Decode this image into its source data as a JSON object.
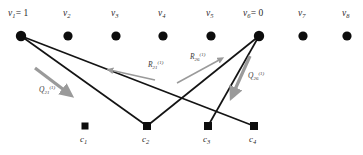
{
  "figure": {
    "type": "tanner-graph",
    "width": 363,
    "height": 155,
    "background": "#ffffff",
    "edge_color": "#141414",
    "node_color": "#0d0d0d",
    "arrow_color": "#9a9a9a"
  },
  "variable_nodes": [
    {
      "id": "v1",
      "label": "v",
      "sub": "1",
      "value": "= 1",
      "x": 21,
      "y": 36,
      "r": 5.2
    },
    {
      "id": "v2",
      "label": "v",
      "sub": "2",
      "value": "",
      "x": 68,
      "y": 36,
      "r": 4.6
    },
    {
      "id": "v3",
      "label": "v",
      "sub": "3",
      "value": "",
      "x": 116,
      "y": 36,
      "r": 4.6
    },
    {
      "id": "v4",
      "label": "v",
      "sub": "4",
      "value": "",
      "x": 163,
      "y": 36,
      "r": 4.6
    },
    {
      "id": "v5",
      "label": "v",
      "sub": "5",
      "value": "",
      "x": 211,
      "y": 36,
      "r": 4.6
    },
    {
      "id": "v6",
      "label": "v",
      "sub": "6",
      "value": "= 0",
      "x": 259,
      "y": 36,
      "r": 5.2
    },
    {
      "id": "v7",
      "label": "v",
      "sub": "7",
      "value": "",
      "x": 303,
      "y": 36,
      "r": 4.6
    },
    {
      "id": "v8",
      "label": "v",
      "sub": "8",
      "value": "",
      "x": 347,
      "y": 36,
      "r": 4.6
    }
  ],
  "check_nodes": [
    {
      "id": "c1",
      "label": "c",
      "sub": "1",
      "x": 85,
      "y": 126,
      "size": 7
    },
    {
      "id": "c2",
      "label": "c",
      "sub": "2",
      "x": 147,
      "y": 126,
      "size": 8
    },
    {
      "id": "c3",
      "label": "c",
      "sub": "3",
      "x": 208,
      "y": 126,
      "size": 8
    },
    {
      "id": "c4",
      "label": "c",
      "sub": "4",
      "x": 254,
      "y": 126,
      "size": 8
    }
  ],
  "edges": [
    {
      "id": "e-v1-c2",
      "from": "v1",
      "to": "c2"
    },
    {
      "id": "e-v1-c4",
      "from": "v1",
      "to": "c4"
    },
    {
      "id": "e-v6-c2",
      "from": "v6",
      "to": "c2"
    },
    {
      "id": "e-v6-c3",
      "from": "v6",
      "to": "c3"
    }
  ],
  "messages": [
    {
      "id": "q-left",
      "text": "Q",
      "sub": "21",
      "sup": "(1)",
      "label_x": 39,
      "label_y": 85,
      "arrow": {
        "x1": 35,
        "y1": 68,
        "x2": 68,
        "y2": 93
      },
      "direction": "variable-to-check"
    },
    {
      "id": "r-left",
      "text": "R",
      "sub": "21",
      "sup": "(1)",
      "label_x": 148,
      "label_y": 60,
      "arrow": {
        "x1": 155,
        "y1": 80,
        "x2": 108,
        "y2": 70
      },
      "direction": "check-to-variable"
    },
    {
      "id": "r-right",
      "text": "R",
      "sub": "26",
      "sup": "(1)",
      "label_x": 190,
      "label_y": 52,
      "arrow": {
        "x1": 177,
        "y1": 83,
        "x2": 222,
        "y2": 58
      },
      "direction": "check-to-variable"
    },
    {
      "id": "q-right",
      "text": "Q",
      "sub": "26",
      "sup": "(1)",
      "label_x": 248,
      "label_y": 71,
      "arrow": {
        "x1": 250,
        "y1": 56,
        "x2": 232,
        "y2": 95
      },
      "direction": "variable-to-check"
    }
  ]
}
